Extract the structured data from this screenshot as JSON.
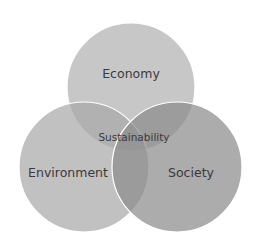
{
  "diagram": {
    "type": "venn",
    "circles": [
      {
        "id": "economy",
        "label": "Economy",
        "cx": 131,
        "cy": 87,
        "r": 64,
        "fill": "#bdbdbd"
      },
      {
        "id": "environment",
        "label": "Environment",
        "cx": 84,
        "cy": 167,
        "r": 65,
        "fill": "#b5b5b5"
      },
      {
        "id": "society",
        "label": "Society",
        "cx": 177,
        "cy": 167,
        "r": 65,
        "fill": "#9a9a9a"
      }
    ],
    "center_label": "Sustainability",
    "stroke_color": "#ffffff"
  }
}
